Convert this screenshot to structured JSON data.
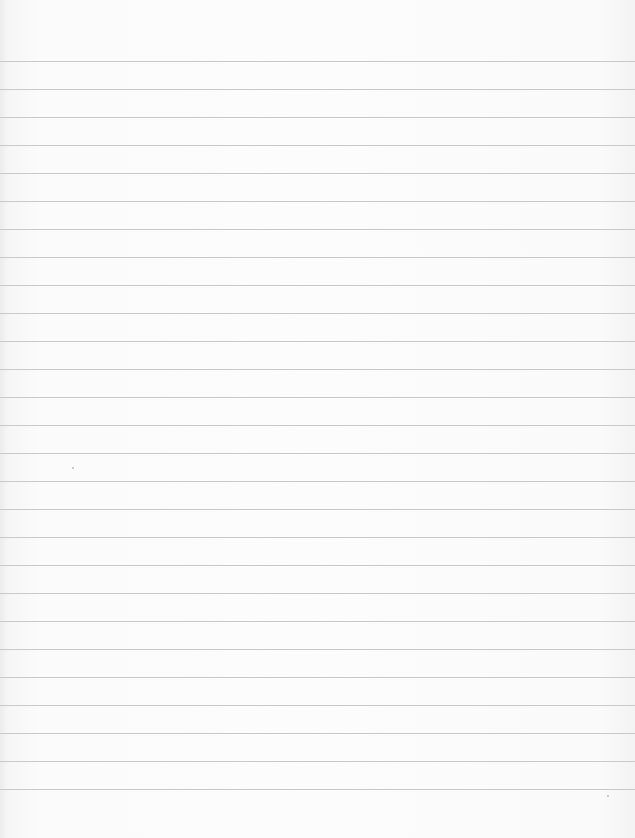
{
  "page": {
    "type": "lined-paper",
    "background_color": "#fbfbfb",
    "rule_color": "#c9c9c9",
    "first_rule_y": 61,
    "rule_spacing": 28,
    "rule_count": 27,
    "text": ""
  }
}
